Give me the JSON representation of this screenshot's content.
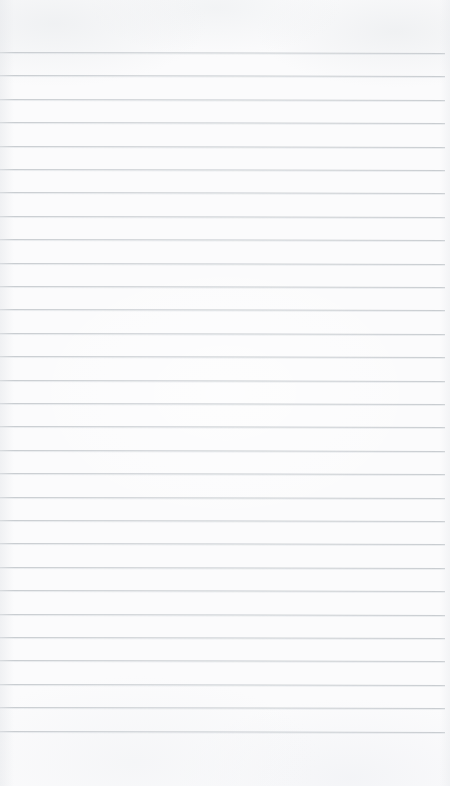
{
  "page": {
    "kind": "ruled-notebook-paper",
    "width_px": 450,
    "height_px": 786,
    "background_color": "#fbfbfc",
    "content_text": "",
    "has_text": false,
    "has_header": false,
    "has_vertical_margin_rule": false
  },
  "rules": {
    "line_color": "#c9cdd1",
    "line_thickness_px": 1,
    "line_count": 30,
    "first_line_y_px": 52,
    "last_line_y_px": 730,
    "line_spacing_px": 23.4,
    "line_start_x_px": 0,
    "line_end_x_px": 445,
    "slant_degrees": 0.13,
    "top_margin_px": 52,
    "bottom_margin_px": 56,
    "positions_y_px": [
      52,
      75.4,
      98.8,
      122.2,
      145.6,
      169,
      192.4,
      215.8,
      239.2,
      262.6,
      286,
      309.4,
      332.8,
      356.2,
      379.6,
      403,
      426.4,
      449.8,
      473.2,
      496.6,
      520,
      543.4,
      566.8,
      590.2,
      613.6,
      637,
      660.4,
      683.8,
      707.2,
      730.6
    ]
  }
}
